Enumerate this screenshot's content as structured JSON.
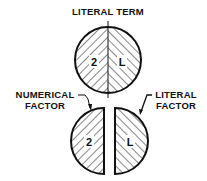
{
  "diagram": {
    "title": "LITERAL TERM",
    "whole_term": {
      "left_symbol": "2",
      "right_symbol": "L"
    },
    "split_term": {
      "left_symbol": "2",
      "right_symbol": "L",
      "left_label_line1": "NUMERICAL",
      "left_label_line2": "FACTOR",
      "right_label_line1": "LITERAL",
      "right_label_line2": "FACTOR"
    },
    "colors": {
      "ink": "#111111",
      "background": "#ffffff"
    }
  }
}
